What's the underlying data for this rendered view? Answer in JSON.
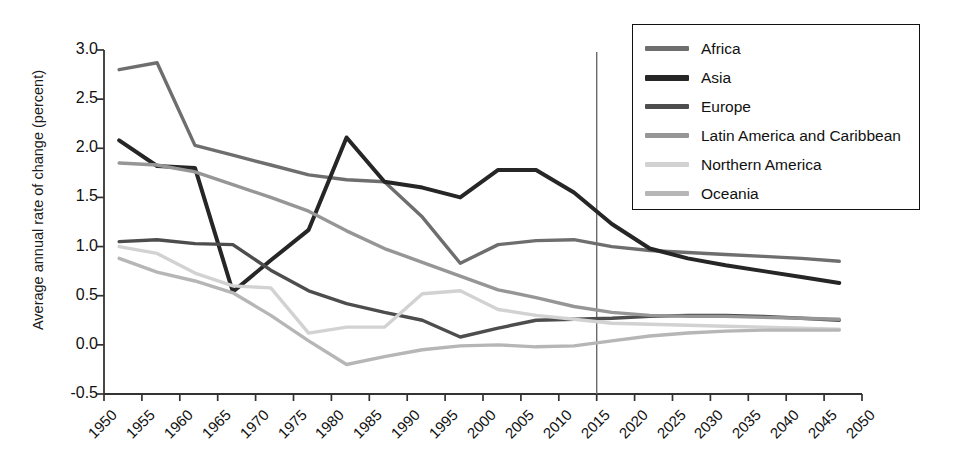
{
  "chart_data": {
    "type": "line",
    "title": "",
    "xlabel": "",
    "ylabel": "Average annual rate of change (percent)",
    "xlim": [
      1950,
      2050
    ],
    "ylim": [
      -0.5,
      3.0
    ],
    "grid": false,
    "legend_position": "top-right",
    "x_tick_labels": [
      "1950",
      "1955",
      "1960",
      "1965",
      "1970",
      "1975",
      "1980",
      "1985",
      "1990",
      "1995",
      "2000",
      "2005",
      "2010",
      "2015",
      "2020",
      "2025",
      "2030",
      "2035",
      "2040",
      "2045",
      "2050"
    ],
    "y_tick_labels": [
      "3.0",
      "2.5",
      "2.0",
      "1.5",
      "1.0",
      "0.5",
      "0.0",
      "-0.5"
    ],
    "y_tick_values": [
      3.0,
      2.5,
      2.0,
      1.5,
      1.0,
      0.5,
      0.0,
      -0.5
    ],
    "annotations": [
      {
        "name": "projection-divider",
        "type": "vline",
        "x": 2015,
        "label": ""
      }
    ],
    "x": [
      1952,
      1957,
      1962,
      1967,
      1972,
      1977,
      1982,
      1987,
      1992,
      1997,
      2002,
      2007,
      2012,
      2017,
      2022,
      2027,
      2032,
      2037,
      2042,
      2047
    ],
    "series": [
      {
        "name": "Africa",
        "color": "#6e6e6e",
        "values": [
          2.8,
          2.87,
          2.03,
          1.93,
          1.83,
          1.73,
          1.68,
          1.66,
          1.3,
          0.83,
          1.02,
          1.06,
          1.07,
          1.0,
          0.96,
          0.94,
          0.92,
          0.9,
          0.88,
          0.85
        ]
      },
      {
        "name": "Asia",
        "color": "#262626",
        "values": [
          2.08,
          1.82,
          1.8,
          0.54,
          0.86,
          1.17,
          2.11,
          1.66,
          1.6,
          1.5,
          1.78,
          1.78,
          1.55,
          1.23,
          0.98,
          0.88,
          0.81,
          0.75,
          0.69,
          0.63
        ]
      },
      {
        "name": "Europe",
        "color": "#4d4d4d",
        "values": [
          1.05,
          1.07,
          1.03,
          1.02,
          0.76,
          0.55,
          0.42,
          0.33,
          0.25,
          0.08,
          0.17,
          0.25,
          0.26,
          0.27,
          0.29,
          0.3,
          0.3,
          0.29,
          0.27,
          0.25
        ]
      },
      {
        "name": "Latin America and Caribbean",
        "color": "#969696",
        "values": [
          1.85,
          1.83,
          1.76,
          1.63,
          1.5,
          1.36,
          1.16,
          0.98,
          0.84,
          0.7,
          0.56,
          0.48,
          0.39,
          0.33,
          0.3,
          0.29,
          0.29,
          0.28,
          0.27,
          0.26
        ]
      },
      {
        "name": "Northern America",
        "color": "#d2d2d2",
        "values": [
          1.0,
          0.93,
          0.73,
          0.6,
          0.58,
          0.12,
          0.18,
          0.18,
          0.52,
          0.55,
          0.36,
          0.3,
          0.26,
          0.22,
          0.21,
          0.2,
          0.19,
          0.18,
          0.17,
          0.16
        ]
      },
      {
        "name": "Oceania",
        "color": "#b6b6b6",
        "values": [
          0.88,
          0.74,
          0.65,
          0.53,
          0.3,
          0.04,
          -0.2,
          -0.12,
          -0.05,
          -0.01,
          0.0,
          -0.02,
          -0.01,
          0.04,
          0.09,
          0.12,
          0.14,
          0.15,
          0.15,
          0.15
        ]
      }
    ]
  },
  "legend": {
    "items": [
      {
        "label": "Africa"
      },
      {
        "label": "Asia"
      },
      {
        "label": "Europe"
      },
      {
        "label": "Latin America and Caribbean"
      },
      {
        "label": "Northern America"
      },
      {
        "label": "Oceania"
      }
    ]
  }
}
